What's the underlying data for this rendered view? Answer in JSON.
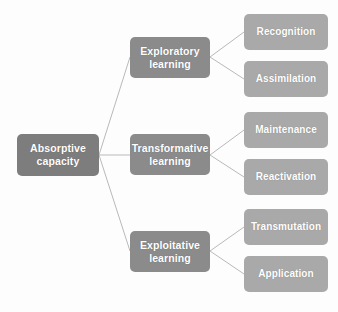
{
  "diagram": {
    "title": "Absorptive capacity",
    "type": "hierarchy-tree",
    "orientation": "left-to-right",
    "colors": {
      "root_box": "#7d7d7d",
      "mid_box": "#8b8b8b",
      "leaf_box": "#a9a9a9",
      "label_text": "#ffffff",
      "connector_line": "#b9b9b9",
      "background": "#fdfdfd"
    },
    "root": {
      "id": "absorptive-capacity",
      "label": "Absorptive\ncapacity",
      "x": 17,
      "y": 134,
      "w": 82,
      "h": 42
    },
    "branches": [
      {
        "id": "exploratory-learning",
        "label": "Exploratory\nlearning",
        "x": 130,
        "y": 37,
        "w": 80,
        "h": 41,
        "children": [
          {
            "id": "recognition",
            "label": "Recognition",
            "x": 244,
            "y": 14,
            "w": 84,
            "h": 36
          },
          {
            "id": "assimilation",
            "label": "Assimilation",
            "x": 244,
            "y": 61,
            "w": 84,
            "h": 36
          }
        ]
      },
      {
        "id": "transformative-learning",
        "label": "Transformative\nlearning",
        "x": 130,
        "y": 134,
        "w": 80,
        "h": 41,
        "children": [
          {
            "id": "maintenance",
            "label": "Maintenance",
            "x": 244,
            "y": 112,
            "w": 84,
            "h": 36
          },
          {
            "id": "reactivation",
            "label": "Reactivation",
            "x": 244,
            "y": 159,
            "w": 84,
            "h": 36
          }
        ]
      },
      {
        "id": "exploitative-learning",
        "label": "Exploitative\nlearning",
        "x": 130,
        "y": 231,
        "w": 80,
        "h": 41,
        "children": [
          {
            "id": "transmutation",
            "label": "Transmutation",
            "x": 244,
            "y": 209,
            "w": 84,
            "h": 36
          },
          {
            "id": "application",
            "label": "Application",
            "x": 244,
            "y": 256,
            "w": 84,
            "h": 36
          }
        ]
      }
    ],
    "edges": [
      {
        "id": "edge-root-exploratory",
        "from": "absorptive-capacity",
        "to": "exploratory-learning",
        "x1": 99,
        "y1": 155,
        "x2": 130,
        "y2": 57
      },
      {
        "id": "edge-root-transformative",
        "from": "absorptive-capacity",
        "to": "transformative-learning",
        "x1": 99,
        "y1": 155,
        "x2": 130,
        "y2": 155
      },
      {
        "id": "edge-root-exploitative",
        "from": "absorptive-capacity",
        "to": "exploitative-learning",
        "x1": 99,
        "y1": 155,
        "x2": 130,
        "y2": 251
      },
      {
        "id": "edge-exploratory-recognition",
        "from": "exploratory-learning",
        "to": "recognition",
        "x1": 210,
        "y1": 57,
        "x2": 244,
        "y2": 32
      },
      {
        "id": "edge-exploratory-assimilation",
        "from": "exploratory-learning",
        "to": "assimilation",
        "x1": 210,
        "y1": 57,
        "x2": 244,
        "y2": 79
      },
      {
        "id": "edge-transformative-maintenance",
        "from": "transformative-learning",
        "to": "maintenance",
        "x1": 210,
        "y1": 155,
        "x2": 244,
        "y2": 130
      },
      {
        "id": "edge-transformative-reactivation",
        "from": "transformative-learning",
        "to": "reactivation",
        "x1": 210,
        "y1": 155,
        "x2": 244,
        "y2": 177
      },
      {
        "id": "edge-exploitative-transmutation",
        "from": "exploitative-learning",
        "to": "transmutation",
        "x1": 210,
        "y1": 251,
        "x2": 244,
        "y2": 227
      },
      {
        "id": "edge-exploitative-application",
        "from": "exploitative-learning",
        "to": "application",
        "x1": 210,
        "y1": 251,
        "x2": 244,
        "y2": 274
      }
    ]
  }
}
